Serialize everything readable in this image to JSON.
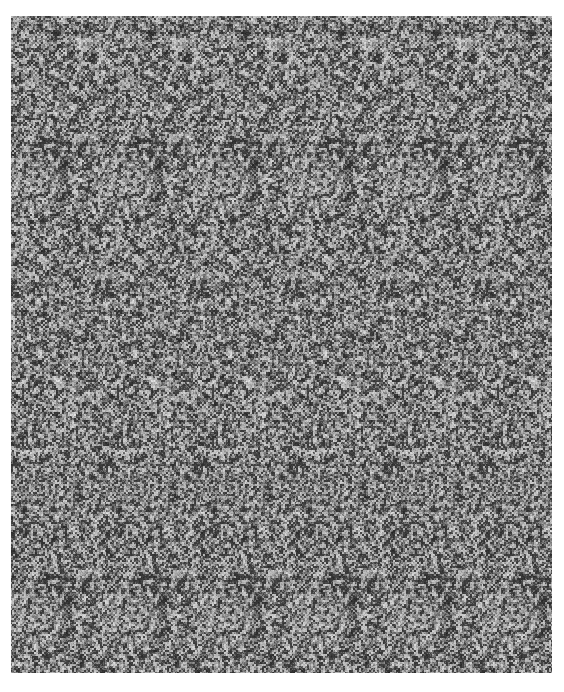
{
  "image": {
    "kind": "random-dot autostereogram",
    "x": 11,
    "y": 16,
    "width": 541,
    "height": 657,
    "tile_period_px": 95,
    "palette": {
      "dark": "#1e1e1e",
      "mid": "#6a6a6a",
      "light": "#d8d8d8",
      "background": "#ffffff"
    }
  }
}
